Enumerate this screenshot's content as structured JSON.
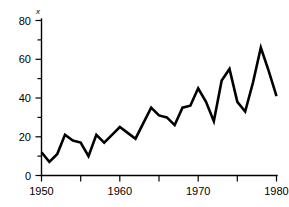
{
  "chart_data": {
    "type": "line",
    "title": "",
    "subtitle": "",
    "xlabel": "",
    "ylabel": "x",
    "ylabel_style": "italic",
    "xlim": [
      1950,
      1980
    ],
    "ylim": [
      0,
      80
    ],
    "grid": false,
    "legend": false,
    "legend_position": "none",
    "y_ticks_major": [
      0,
      20,
      40,
      60,
      80
    ],
    "y_tick_labels": [
      "0",
      "20",
      "40",
      "60",
      "80"
    ],
    "y_ticks_minor": [
      10,
      30,
      50,
      70
    ],
    "x_ticks_major": [
      1950,
      1960,
      1970,
      1980
    ],
    "x_tick_labels": [
      "1950",
      "1960",
      "1970",
      "1980"
    ],
    "x_ticks_minor": [
      1955,
      1965,
      1975
    ],
    "line_color": "#000000",
    "background_color": "#ffffff",
    "x": [
      1950,
      1951,
      1952,
      1953,
      1954,
      1955,
      1956,
      1957,
      1958,
      1959,
      1960,
      1961,
      1962,
      1963,
      1964,
      1965,
      1966,
      1967,
      1968,
      1969,
      1970,
      1971,
      1972,
      1973,
      1974,
      1975,
      1976,
      1977,
      1978,
      1979,
      1980
    ],
    "values": [
      12,
      7,
      11,
      21,
      18,
      17,
      10,
      21,
      17,
      21,
      25,
      22,
      19,
      27,
      35,
      31,
      30,
      26,
      35,
      36,
      45,
      38,
      28,
      49,
      55,
      38,
      33,
      48,
      66,
      54,
      41
    ],
    "series": [
      {
        "name": "x",
        "values": [
          12,
          7,
          11,
          21,
          18,
          17,
          10,
          21,
          17,
          21,
          25,
          22,
          19,
          27,
          35,
          31,
          30,
          26,
          35,
          36,
          45,
          38,
          28,
          49,
          55,
          38,
          33,
          48,
          66,
          54,
          41
        ]
      }
    ],
    "annotations": []
  }
}
